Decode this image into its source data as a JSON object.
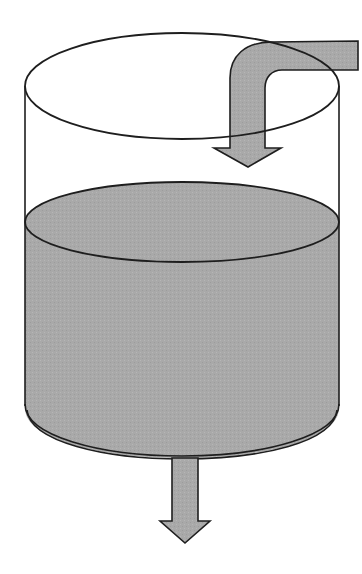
{
  "diagram": {
    "colors": {
      "background": "#ffffff",
      "outline": "#1e1e1e",
      "liquid": "#a9a9a9",
      "arrow": "#a3a3a3"
    },
    "elements": {
      "tank": {
        "label": ""
      },
      "liquid": {
        "label": ""
      },
      "inflow_arrow": {
        "label": ""
      },
      "outflow_arrow": {
        "label": ""
      }
    }
  }
}
